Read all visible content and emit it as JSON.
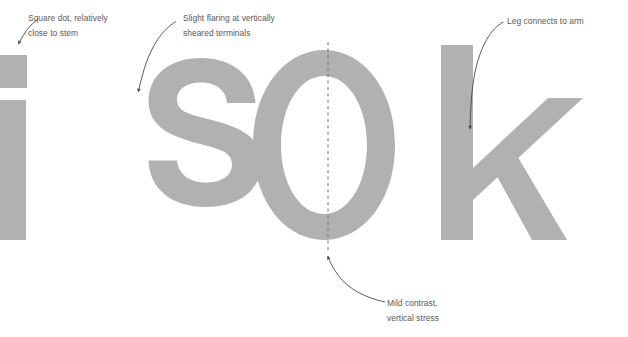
{
  "document": {
    "kind": "type-specimen-annotation-diagram",
    "background_color": "#ffffff"
  },
  "specimen": {
    "sample_text": "is Ok",
    "glyph_color": "#b0b1b1",
    "glyphs": [
      {
        "char": "i",
        "name": "glyph-i",
        "case": "lowercase",
        "parts": [
          "square-dot",
          "stem"
        ]
      },
      {
        "char": "s",
        "name": "glyph-s",
        "case": "lowercase",
        "parts": [
          "spine",
          "terminals"
        ]
      },
      {
        "char": "O",
        "name": "glyph-o",
        "case": "uppercase",
        "parts": [
          "bowl"
        ]
      },
      {
        "char": "k",
        "name": "glyph-k",
        "case": "lowercase",
        "parts": [
          "stem",
          "arm",
          "leg"
        ]
      }
    ]
  },
  "guides": {
    "stress_axis": {
      "label": "vertical-stress-axis",
      "color": "#6d6e70",
      "style": "dashed",
      "orientation": "vertical"
    }
  },
  "annotations": [
    {
      "id": "square-dot",
      "text": "Square dot, relatively\nclose to stem",
      "target": "i-dot",
      "arrow": "curved-down-left"
    },
    {
      "id": "flaring",
      "text": "Slight flaring at vertically\nsheared terminals",
      "target": "s-terminal",
      "arrow": "curved-down-left"
    },
    {
      "id": "leg-arm",
      "text": "Leg connects to arm",
      "target": "k-junction",
      "arrow": "curved-down-left"
    },
    {
      "id": "contrast",
      "text": "Mild contrast,\nvertical stress",
      "target": "o-bowl-bottom",
      "arrow": "curved-up-left"
    }
  ],
  "colors": {
    "glyph": "#b0b1b1",
    "annotation_text": "#58585a",
    "arrow": "#3e3e40",
    "guide": "#6d6e70"
  }
}
